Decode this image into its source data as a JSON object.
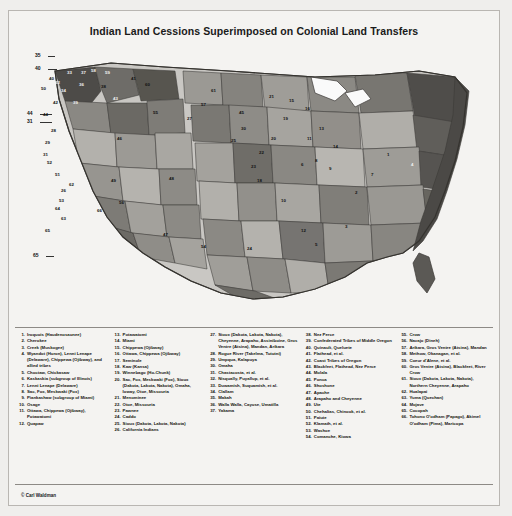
{
  "figure": {
    "title": "Indian Land Cessions Superimposed on Colonial Land Transfers",
    "credit": "© Carl Waldman"
  },
  "map": {
    "region_numbers": [
      "1",
      "2",
      "3",
      "4",
      "5",
      "6",
      "7",
      "8",
      "9",
      "10",
      "11",
      "12",
      "13",
      "14",
      "15",
      "16",
      "17",
      "18",
      "19",
      "20",
      "21",
      "22",
      "23",
      "24",
      "25",
      "26",
      "27",
      "28",
      "29",
      "30",
      "31",
      "32",
      "33",
      "34",
      "35",
      "36",
      "37",
      "38",
      "39",
      "40",
      "41",
      "42",
      "43",
      "44",
      "45",
      "46",
      "47",
      "48",
      "49",
      "50",
      "51",
      "52",
      "53",
      "54",
      "55",
      "56",
      "57",
      "58",
      "59",
      "60",
      "61",
      "62",
      "63",
      "64",
      "65",
      "66"
    ],
    "edge_labels": [
      "35",
      "40",
      "44",
      "31",
      "65"
    ]
  },
  "legend": {
    "columns": [
      {
        "items": [
          {
            "num": "1.",
            "text": "Iroquois (Haudenosaunee)"
          },
          {
            "num": "2.",
            "text": "Cherokee"
          },
          {
            "num": "3.",
            "text": "Creek (Muskogee)"
          },
          {
            "num": "4.",
            "text": "Wyandot (Huron), Lenni Lenape (Delaware), Chippewa (Ojibway), and allied tribes"
          },
          {
            "num": "5.",
            "text": "Choctaw, Chickasaw"
          },
          {
            "num": "6.",
            "text": "Kaskaskia (subgroup of Illinois)"
          },
          {
            "num": "7.",
            "text": "Lenni Lenape (Delaware)"
          },
          {
            "num": "8.",
            "text": "Sac, Fox, Meskwaki (Fox)"
          },
          {
            "num": "9.",
            "text": "Piankashaw (subgroup of Miami)"
          },
          {
            "num": "10.",
            "text": "Osage"
          },
          {
            "num": "11.",
            "text": "Ottawa, Chippewa (Ojibway), Potawatomi"
          },
          {
            "num": "12.",
            "text": "Quapaw"
          }
        ]
      },
      {
        "items": [
          {
            "num": "13.",
            "text": "Potawatomi"
          },
          {
            "num": "14.",
            "text": "Miami"
          },
          {
            "num": "15.",
            "text": "Chippewa (Ojibway)"
          },
          {
            "num": "16.",
            "text": "Ottawa, Chippewa (Ojibway)"
          },
          {
            "num": "17.",
            "text": "Seminole"
          },
          {
            "num": "18.",
            "text": "Kaw (Kansa)"
          },
          {
            "num": "19.",
            "text": "Winnebago (Ho-Chunk)"
          },
          {
            "num": "20.",
            "text": "Sac, Fox, Meskwaki (Fox), Sioux (Dakota, Lakota, Nakota), Omaha, Ioway, Otoe, Missouria"
          },
          {
            "num": "21.",
            "text": "Menominee"
          },
          {
            "num": "22.",
            "text": "Otoe, Missouria"
          },
          {
            "num": "23.",
            "text": "Pawnee"
          },
          {
            "num": "24.",
            "text": "Caddo"
          },
          {
            "num": "25.",
            "text": "Sioux (Dakota, Lakota, Nakota)"
          },
          {
            "num": "26.",
            "text": "California Indians"
          }
        ]
      },
      {
        "items": [
          {
            "num": "27.",
            "text": "Sioux (Dakota, Lakota, Nakota), Cheyenne, Arapaho, Assiniboine, Gros Ventre (Atsina), Mandan, Arikara"
          },
          {
            "num": "28.",
            "text": "Rogue River (Takelma, Tututni)"
          },
          {
            "num": "29.",
            "text": "Umpqua, Kalapuya"
          },
          {
            "num": "30.",
            "text": "Omaha"
          },
          {
            "num": "31.",
            "text": "Chastacosta, et al."
          },
          {
            "num": "32.",
            "text": "Nisqually, Puyallup, et al."
          },
          {
            "num": "33.",
            "text": "Duwamish, Suquamish, et al."
          },
          {
            "num": "34.",
            "text": "Clallam"
          },
          {
            "num": "35.",
            "text": "Makah"
          },
          {
            "num": "36.",
            "text": "Walla Walla, Cayuse, Umatilla"
          },
          {
            "num": "37.",
            "text": "Yakama"
          }
        ]
      },
      {
        "items": [
          {
            "num": "38.",
            "text": "Nez Perce"
          },
          {
            "num": "39.",
            "text": "Confederated Tribes of Middle Oregon"
          },
          {
            "num": "40.",
            "text": "Quinault, Queluete"
          },
          {
            "num": "41.",
            "text": "Flathead, et al."
          },
          {
            "num": "42.",
            "text": "Coast Tribes of Oregon"
          },
          {
            "num": "43.",
            "text": "Blackfeet, Flathead, Nez Perce"
          },
          {
            "num": "44.",
            "text": "Molala"
          },
          {
            "num": "45.",
            "text": "Ponca"
          },
          {
            "num": "46.",
            "text": "Shoshone"
          },
          {
            "num": "47.",
            "text": "Apache"
          },
          {
            "num": "48.",
            "text": "Arapaho and Cheyenne"
          },
          {
            "num": "49.",
            "text": "Ute"
          },
          {
            "num": "50.",
            "text": "Chehalias, Chinook, et al."
          },
          {
            "num": "51.",
            "text": "Paiute"
          },
          {
            "num": "52.",
            "text": "Klamath, et al."
          },
          {
            "num": "53.",
            "text": "Washoe"
          },
          {
            "num": "54.",
            "text": "Comanche, Kiowa"
          }
        ]
      },
      {
        "items": [
          {
            "num": "55.",
            "text": "Crow"
          },
          {
            "num": "56.",
            "text": "Navajo (Dineh)"
          },
          {
            "num": "57.",
            "text": "Arikara, Gros Ventre (Atsina), Mandan"
          },
          {
            "num": "58.",
            "text": "Methow, Okanagan, et al."
          },
          {
            "num": "59.",
            "text": "Coeur d'Alene, et al."
          },
          {
            "num": "60.",
            "text": "Gros Ventre (Atsina), Blackfeet, River Crow"
          },
          {
            "num": "61.",
            "text": "Sioux (Dakota, Lakota, Nakota), Northern Cheyenne, Arapaho"
          },
          {
            "num": "62.",
            "text": "Hualapai"
          },
          {
            "num": "63.",
            "text": "Yuma (Quechan)"
          },
          {
            "num": "64.",
            "text": "Mojave"
          },
          {
            "num": "65.",
            "text": "Cocopah"
          },
          {
            "num": "66.",
            "text": "Tohono O'odham (Papago), Akimel O'odham (Pima), Maricopa"
          }
        ]
      }
    ]
  }
}
